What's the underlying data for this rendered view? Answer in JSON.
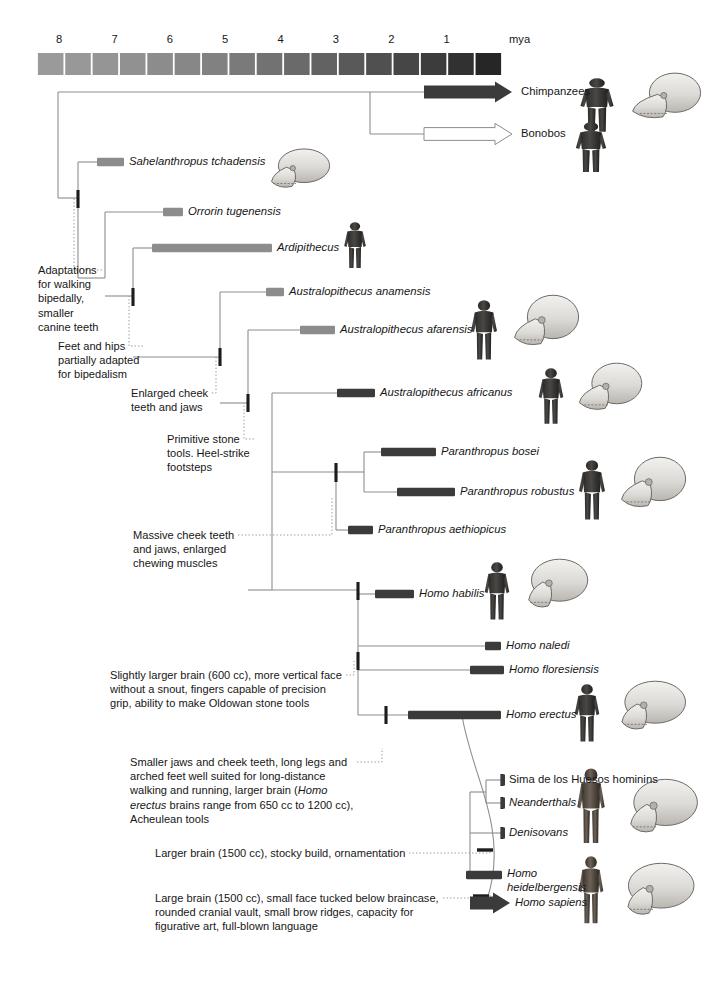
{
  "figure": {
    "axis": {
      "unit_label": "mya",
      "ticks": [
        "8",
        "7",
        "6",
        "5",
        "4",
        "3",
        "2",
        "1"
      ],
      "tick_values": [
        8,
        7,
        6,
        5,
        4,
        3,
        2,
        1
      ],
      "range_start": 8.4,
      "range_end": 0.0,
      "band_count": 17,
      "band_color_light": "#9a9a9a",
      "band_color_dark": "#262626"
    },
    "colors": {
      "branch_line": "#8d8d8d",
      "bar_light": "#8c8c8c",
      "bar_dark": "#3b3b3b",
      "arrow_dark": "#3b3b3b",
      "arrow_open": "#ffffff",
      "text": "#161616",
      "leader_line": "#9a9a9a",
      "node_mark": "#1c1c1c"
    }
  },
  "taxa": [
    {
      "id": "chimpanzees",
      "label": "Chimpanzees",
      "style": "arrow-filled",
      "italic": false,
      "y": 92,
      "bar_start_x": 424,
      "bar_end_x": 512,
      "label_x": 521
    },
    {
      "id": "bonobos",
      "label": "Bonobos",
      "style": "arrow-open",
      "italic": false,
      "y": 134,
      "bar_start_x": 424,
      "bar_end_x": 512,
      "label_x": 521
    },
    {
      "id": "sahelanthropus-tchadensis",
      "label": "Sahelanthropus tchadensis",
      "style": "bar-light",
      "italic": true,
      "y": 162,
      "bar_start_x": 97,
      "bar_end_x": 124,
      "label_x": 129
    },
    {
      "id": "orrorin-tugenensis",
      "label": "Orrorin tugenensis",
      "style": "bar-light",
      "italic": true,
      "y": 212,
      "bar_start_x": 163,
      "bar_end_x": 183,
      "label_x": 188
    },
    {
      "id": "ardipithecus",
      "label": "Ardipithecus",
      "style": "bar-light",
      "italic": true,
      "y": 248,
      "bar_start_x": 152,
      "bar_end_x": 272,
      "label_x": 277
    },
    {
      "id": "australopithecus-anamensis",
      "label": "Australopithecus anamensis",
      "style": "bar-light",
      "italic": true,
      "y": 292,
      "bar_start_x": 266,
      "bar_end_x": 284,
      "label_x": 289
    },
    {
      "id": "australopithecus-afarensis",
      "label": "Australopithecus afarensis",
      "style": "bar-light",
      "italic": true,
      "y": 330,
      "bar_start_x": 300,
      "bar_end_x": 335,
      "label_x": 340
    },
    {
      "id": "australopithecus-africanus",
      "label": "Australopithecus africanus",
      "style": "bar-dark",
      "italic": true,
      "y": 393,
      "bar_start_x": 337,
      "bar_end_x": 375,
      "label_x": 380
    },
    {
      "id": "paranthropus-bosei",
      "label": "Paranthropus bosei",
      "style": "bar-dark",
      "italic": true,
      "y": 452,
      "bar_start_x": 381,
      "bar_end_x": 436,
      "label_x": 441
    },
    {
      "id": "paranthropus-robustus",
      "label": "Paranthropus robustus",
      "style": "bar-dark",
      "italic": true,
      "y": 492,
      "bar_start_x": 397,
      "bar_end_x": 455,
      "label_x": 460
    },
    {
      "id": "paranthropus-aethiopicus",
      "label": "Paranthropus aethiopicus",
      "style": "bar-dark",
      "italic": true,
      "y": 530,
      "bar_start_x": 348,
      "bar_end_x": 373,
      "label_x": 378
    },
    {
      "id": "homo-habilis",
      "label": "Homo habilis",
      "style": "bar-dark",
      "italic": true,
      "y": 594,
      "bar_start_x": 375,
      "bar_end_x": 414,
      "label_x": 419
    },
    {
      "id": "homo-naledi",
      "label": "Homo naledi",
      "style": "bar-dark",
      "italic": true,
      "y": 646,
      "bar_start_x": 485,
      "bar_end_x": 501,
      "label_x": 506
    },
    {
      "id": "homo-floresiensis",
      "label": "Homo floresiensis",
      "style": "bar-dark",
      "italic": true,
      "y": 670,
      "bar_start_x": 470,
      "bar_end_x": 504,
      "label_x": 509
    },
    {
      "id": "homo-erectus",
      "label": "Homo erectus",
      "style": "bar-dark",
      "italic": true,
      "y": 715,
      "bar_start_x": 408,
      "bar_end_x": 501,
      "label_x": 506
    },
    {
      "id": "sima-de-los-huesos-hominins",
      "label": "Sima de los Huesos hominins",
      "style": "bar-dark-thin",
      "italic": false,
      "y": 780,
      "bar_start_x": 502,
      "bar_end_x": 506,
      "label_x": 509
    },
    {
      "id": "neanderthals",
      "label": "Neanderthals",
      "style": "bar-dark-thin",
      "italic": true,
      "y": 803,
      "bar_start_x": 502,
      "bar_end_x": 506,
      "label_x": 509
    },
    {
      "id": "denisovans",
      "label": "Denisovans",
      "style": "bar-dark-thin",
      "italic": true,
      "y": 833,
      "bar_start_x": 502,
      "bar_end_x": 506,
      "label_x": 509
    },
    {
      "id": "homo-heidelbergensis",
      "label": "Homo heidelbergensis",
      "style": "bar-dark",
      "italic": true,
      "y": 875,
      "bar_start_x": 466,
      "bar_end_x": 502,
      "label_x": 507,
      "label_line2": "heidelbergensis"
    },
    {
      "id": "homo-sapiens",
      "label": "Homo sapiens",
      "style": "arrow-filled",
      "italic": true,
      "y": 903,
      "bar_start_x": 470,
      "bar_end_x": 510,
      "label_x": 515
    }
  ],
  "annotations": [
    {
      "id": "adaptations-bipedal-walking",
      "text": "Adaptations\nfor walking\nbipedally,\nsmaller\ncanine teeth",
      "x": 38,
      "y": 263,
      "leader_to_x": 78,
      "leader_to_y": 198
    },
    {
      "id": "feet-and-hips",
      "text": "Feet and hips\npartially adapted\nfor bipedalism",
      "x": 58,
      "y": 339,
      "leader_to_x": 133,
      "leader_to_y": 296
    },
    {
      "id": "enlarged-cheek-teeth",
      "text": "Enlarged cheek\nteeth and jaws",
      "x": 131,
      "y": 386,
      "leader_to_x": 220,
      "leader_to_y": 357
    },
    {
      "id": "primitive-stone-tools",
      "text": "Primitive stone\ntools. Heel-strike\nfootsteps",
      "x": 167,
      "y": 432,
      "leader_to_x": 248,
      "leader_to_y": 403
    },
    {
      "id": "massive-cheek-teeth",
      "text": "Massive cheek teeth\nand jaws, enlarged\nchewing muscles",
      "x": 133,
      "y": 528,
      "leader_to_x": 336,
      "leader_to_y": 497
    },
    {
      "id": "slightly-larger-brain",
      "text": "Slightly larger brain (600 cc), more vertical face\nwithout a snout, fingers capable of precision\ngrip, ability to make Oldowan stone tools",
      "x": 110,
      "y": 668,
      "leader_to_x": 358,
      "leader_to_y": 661
    },
    {
      "id": "smaller-jaws-long-legs",
      "text": "Smaller jaws and cheek teeth, long legs and\narched feet well suited for long-distance\nwalking and running, larger brain (Homo\nerectus brains range from 650 cc to 1200 cc),\nAcheulean tools",
      "x": 130,
      "y": 755,
      "leader_to_x": 386,
      "leader_to_y": 748
    },
    {
      "id": "larger-brain-stocky",
      "text": "Larger brain (1500 cc), stocky build, ornamentation",
      "x": 155,
      "y": 846,
      "leader_to_x": 494,
      "leader_to_y": 850
    },
    {
      "id": "large-brain-small-face",
      "text": "Large brain (1500 cc), small face tucked below braincase,\nrounded cranial vault, small brow ridges, capacity for\nfigurative art, full-blown language",
      "x": 155,
      "y": 891,
      "leader_to_x": 494,
      "leader_to_y": 895
    }
  ],
  "specimen_figures": [
    {
      "id": "chimpanzee-body",
      "kind": "body-ape",
      "x": 574,
      "y": 78,
      "w": 46,
      "h": 56
    },
    {
      "id": "chimpanzee-skull",
      "kind": "skull-ape",
      "x": 627,
      "y": 72,
      "w": 80,
      "h": 56
    },
    {
      "id": "bonobo-body",
      "kind": "body-ape",
      "x": 570,
      "y": 122,
      "w": 42,
      "h": 52
    },
    {
      "id": "sahelanthropus-skull",
      "kind": "skull-fossil",
      "x": 256,
      "y": 148,
      "w": 80,
      "h": 48
    },
    {
      "id": "ardipithecus-body",
      "kind": "body-hominin",
      "x": 340,
      "y": 222,
      "w": 30,
      "h": 48
    },
    {
      "id": "afarensis-body",
      "kind": "body-hominin",
      "x": 466,
      "y": 300,
      "w": 36,
      "h": 62
    },
    {
      "id": "afarensis-skull",
      "kind": "skull-austral",
      "x": 505,
      "y": 294,
      "w": 80,
      "h": 62
    },
    {
      "id": "africanus-body",
      "kind": "body-hominin",
      "x": 534,
      "y": 368,
      "w": 34,
      "h": 58
    },
    {
      "id": "africanus-skull",
      "kind": "skull-austral",
      "x": 570,
      "y": 362,
      "w": 78,
      "h": 58
    },
    {
      "id": "paranthropus-body",
      "kind": "body-hominin",
      "x": 574,
      "y": 460,
      "w": 36,
      "h": 62
    },
    {
      "id": "paranthropus-skull",
      "kind": "skull-robust",
      "x": 612,
      "y": 456,
      "w": 80,
      "h": 62
    },
    {
      "id": "habilis-body",
      "kind": "body-hominin",
      "x": 480,
      "y": 562,
      "w": 34,
      "h": 60
    },
    {
      "id": "habilis-skull",
      "kind": "skull-homo",
      "x": 514,
      "y": 558,
      "w": 76,
      "h": 60
    },
    {
      "id": "erectus-body",
      "kind": "body-hominin",
      "x": 570,
      "y": 684,
      "w": 34,
      "h": 60
    },
    {
      "id": "erectus-skull",
      "kind": "skull-homo",
      "x": 606,
      "y": 680,
      "w": 82,
      "h": 60
    },
    {
      "id": "neanderthal-body",
      "kind": "body-human",
      "x": 572,
      "y": 768,
      "w": 38,
      "h": 78
    },
    {
      "id": "neanderthal-skull",
      "kind": "skull-neander",
      "x": 614,
      "y": 778,
      "w": 86,
      "h": 66
    },
    {
      "id": "sapiens-body",
      "kind": "body-human",
      "x": 574,
      "y": 856,
      "w": 34,
      "h": 70
    },
    {
      "id": "sapiens-skull",
      "kind": "skull-sapiens",
      "x": 612,
      "y": 862,
      "w": 82,
      "h": 64
    }
  ]
}
